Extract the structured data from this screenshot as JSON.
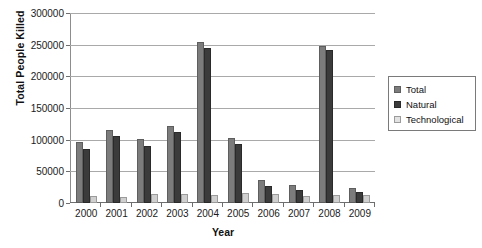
{
  "chart_data": {
    "type": "bar",
    "title": "",
    "xlabel": "Year",
    "ylabel": "Total People Killed",
    "categories": [
      "2000",
      "2001",
      "2002",
      "2003",
      "2004",
      "2005",
      "2006",
      "2007",
      "2008",
      "2009"
    ],
    "series": [
      {
        "name": "Total",
        "color": "#7c7c7c",
        "values": [
          97000,
          116000,
          101000,
          122000,
          254000,
          102000,
          37000,
          29000,
          248000,
          23000
        ]
      },
      {
        "name": "Natural",
        "color": "#3b3b3b",
        "values": [
          86000,
          106000,
          90000,
          112000,
          244000,
          93000,
          27000,
          21000,
          241000,
          17000
        ]
      },
      {
        "name": "Technological",
        "color": "#cfcfcf",
        "values": [
          11000,
          9500,
          14000,
          13500,
          12000,
          16000,
          14000,
          11500,
          12000,
          13000
        ]
      }
    ],
    "ylim": [
      0,
      300000
    ],
    "yticks": [
      0,
      50000,
      100000,
      150000,
      200000,
      250000,
      300000
    ],
    "ytick_labels": [
      "0",
      "50000",
      "100000",
      "150000",
      "200000",
      "250000",
      "300000"
    ],
    "grid": true,
    "legend_position": "right"
  },
  "legend": {
    "items": [
      {
        "label": "Total"
      },
      {
        "label": "Natural"
      },
      {
        "label": "Technological"
      }
    ]
  }
}
